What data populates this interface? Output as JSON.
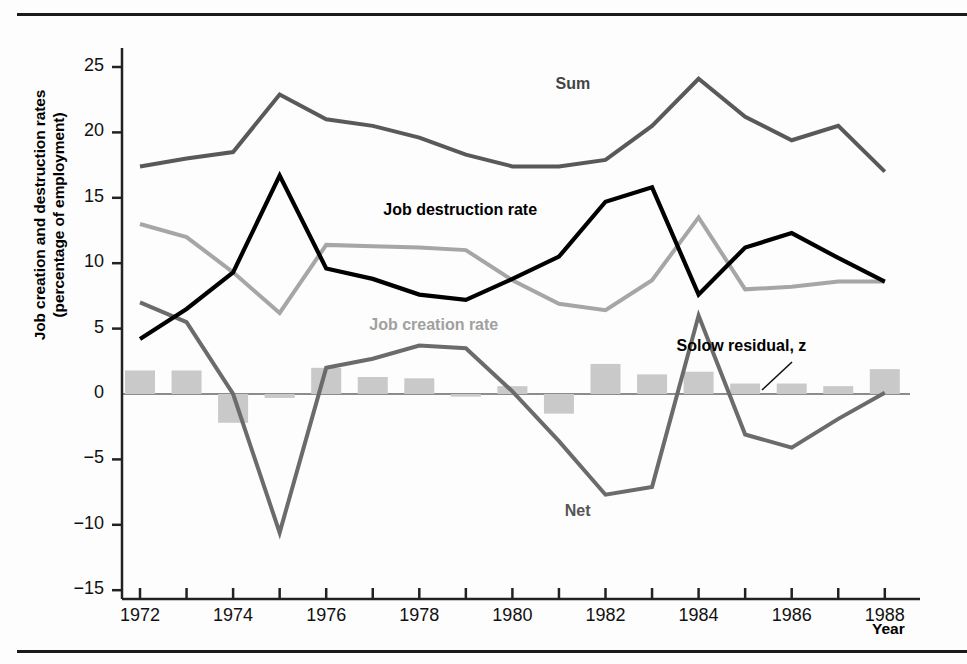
{
  "figure": {
    "ylabel_line1": "Job creation and destruction rates",
    "ylabel_line2": "(percentage of employment)",
    "xlabel": "Year"
  },
  "colors": {
    "sum": "#595959",
    "job_destruction": "#000000",
    "job_creation": "#a6a6a6",
    "net": "#6b6b6b",
    "solow_bars": "#c9c9c9",
    "axis": "#222222",
    "zero_line": "#8c8c8c"
  },
  "chart_data": {
    "type": "line",
    "title": "",
    "xlabel": "Year",
    "ylabel": "Job creation and destruction rates (percentage of employment)",
    "xlim": [
      1971.6,
      1988.4
    ],
    "ylim": [
      -15,
      27
    ],
    "grid": false,
    "legend": "inline-annotations",
    "x": [
      1972,
      1973,
      1974,
      1975,
      1976,
      1977,
      1978,
      1979,
      1980,
      1981,
      1982,
      1983,
      1984,
      1985,
      1986,
      1987,
      1988
    ],
    "xtick_labels": [
      "1972",
      "1974",
      "1976",
      "1978",
      "1980",
      "1982",
      "1984",
      "1986",
      "1988"
    ],
    "xtick_values": [
      1972,
      1974,
      1976,
      1978,
      1980,
      1982,
      1984,
      1986,
      1988
    ],
    "xtick_minor_values": [
      1973,
      1975,
      1977,
      1979,
      1981,
      1983,
      1985,
      1987
    ],
    "ytick_labels": [
      "25",
      "20",
      "15",
      "10",
      "5",
      "0",
      "-5",
      "-10",
      "-15"
    ],
    "ytick_values": [
      25,
      20,
      15,
      10,
      5,
      0,
      -5,
      -10,
      -15
    ],
    "series": [
      {
        "name": "Sum",
        "kind": "line",
        "color": "#595959",
        "label_text": "Sum",
        "values": [
          17.4,
          18.0,
          18.5,
          22.9,
          21.0,
          20.5,
          19.6,
          18.3,
          17.4,
          17.4,
          17.9,
          20.5,
          24.1,
          21.2,
          19.4,
          20.5,
          17.0
        ]
      },
      {
        "name": "Job destruction rate",
        "kind": "line",
        "color": "#000000",
        "label_text": "Job destruction rate",
        "values": [
          4.2,
          6.5,
          9.3,
          16.7,
          9.6,
          8.8,
          7.6,
          7.2,
          8.8,
          10.5,
          14.7,
          15.8,
          7.6,
          11.2,
          12.3,
          10.4,
          8.6
        ]
      },
      {
        "name": "Job creation rate",
        "kind": "line",
        "color": "#a6a6a6",
        "label_text": "Job creation rate",
        "values": [
          13.0,
          12.0,
          9.3,
          6.2,
          11.4,
          11.3,
          11.2,
          11.0,
          8.7,
          6.9,
          6.4,
          8.7,
          13.5,
          8.0,
          8.2,
          8.6,
          8.6
        ]
      },
      {
        "name": "Net",
        "kind": "line",
        "color": "#6b6b6b",
        "label_text": "Net",
        "values": [
          7.0,
          5.5,
          0.0,
          -10.6,
          2.0,
          2.7,
          3.7,
          3.5,
          0.2,
          -3.6,
          -7.7,
          -7.1,
          6.0,
          -3.1,
          -4.1,
          -1.9,
          0.1
        ]
      },
      {
        "name": "Solow residual, z",
        "kind": "bar",
        "color": "#c9c9c9",
        "label_text": "Solow residual, z",
        "values": [
          1.8,
          1.8,
          -2.2,
          -0.3,
          2.0,
          1.3,
          1.2,
          -0.2,
          0.6,
          -1.5,
          2.3,
          1.5,
          1.7,
          0.8,
          0.8,
          0.6,
          1.9
        ]
      }
    ],
    "annotations": [
      {
        "text": "Sum",
        "x": 1982.0,
        "y": 23.6,
        "color": "#444444"
      },
      {
        "text": "Job destruction rate",
        "x": 1978.3,
        "y": 14.0,
        "color": "#000000"
      },
      {
        "text": "Job creation rate",
        "x": 1978.0,
        "y": 5.2,
        "color": "#a0a0a0"
      },
      {
        "text": "Net",
        "x": 1982.2,
        "y": -9.0,
        "color": "#555555"
      },
      {
        "text": "Solow residual, z",
        "x": 1984.6,
        "y": 3.6,
        "color": "#000000"
      }
    ]
  }
}
